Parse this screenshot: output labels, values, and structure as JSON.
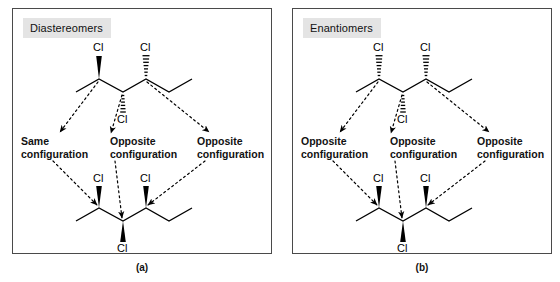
{
  "figure": {
    "caption_a": "(a)",
    "caption_b": "(b)"
  },
  "panels": [
    {
      "id": "a",
      "title": "Diastereomers",
      "caption": "(a)",
      "annotations": [
        {
          "line1": "Same",
          "line2": "configuration"
        },
        {
          "line1": "Opposite",
          "line2": "configuration"
        },
        {
          "line1": "Opposite",
          "line2": "configuration"
        }
      ],
      "top_molecule": {
        "substituent_labels": [
          "Cl",
          "Cl",
          "Cl"
        ],
        "bond_styles": [
          "wedge",
          "hash",
          "hash"
        ],
        "positions": [
          "C2-up",
          "C4-up",
          "C3-down"
        ]
      },
      "bottom_molecule": {
        "substituent_labels": [
          "Cl",
          "Cl",
          "Cl"
        ],
        "bond_styles": [
          "wedge",
          "wedge",
          "wedge"
        ],
        "positions": [
          "C2-up",
          "C4-up",
          "C3-down"
        ]
      }
    },
    {
      "id": "b",
      "title": "Enantiomers",
      "caption": "(b)",
      "annotations": [
        {
          "line1": "Opposite",
          "line2": "configuration"
        },
        {
          "line1": "Opposite",
          "line2": "configuration"
        },
        {
          "line1": "Opposite",
          "line2": "configuration"
        }
      ],
      "top_molecule": {
        "substituent_labels": [
          "Cl",
          "Cl",
          "Cl"
        ],
        "bond_styles": [
          "hash",
          "hash",
          "hash"
        ],
        "positions": [
          "C2-up",
          "C4-up",
          "C3-down"
        ]
      },
      "bottom_molecule": {
        "substituent_labels": [
          "Cl",
          "Cl",
          "Cl"
        ],
        "bond_styles": [
          "wedge",
          "wedge",
          "wedge"
        ],
        "positions": [
          "C2-up",
          "C4-up",
          "C3-down"
        ]
      }
    }
  ],
  "colors": {
    "panel_border": "#4a4a4a",
    "title_background": "#e4e4e4",
    "ink": "#000000",
    "background": "#ffffff"
  }
}
